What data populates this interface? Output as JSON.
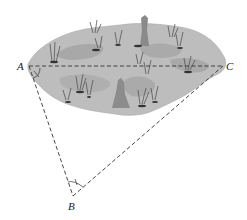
{
  "diagram": {
    "points": {
      "A": {
        "label": "A",
        "x": 29,
        "y": 66
      },
      "B": {
        "label": "B",
        "x": 73,
        "y": 196
      },
      "C": {
        "label": "C",
        "x": 223,
        "y": 66
      }
    },
    "angle_marks": {
      "at_A": "x",
      "at_B": "single tick arc"
    },
    "segments": [
      "AC",
      "AB",
      "BC"
    ],
    "colors": {
      "swamp_fill": "#b9b9b9",
      "swamp_dark": "#9a9a9a",
      "line": "#333333",
      "grass": "#555555"
    }
  }
}
